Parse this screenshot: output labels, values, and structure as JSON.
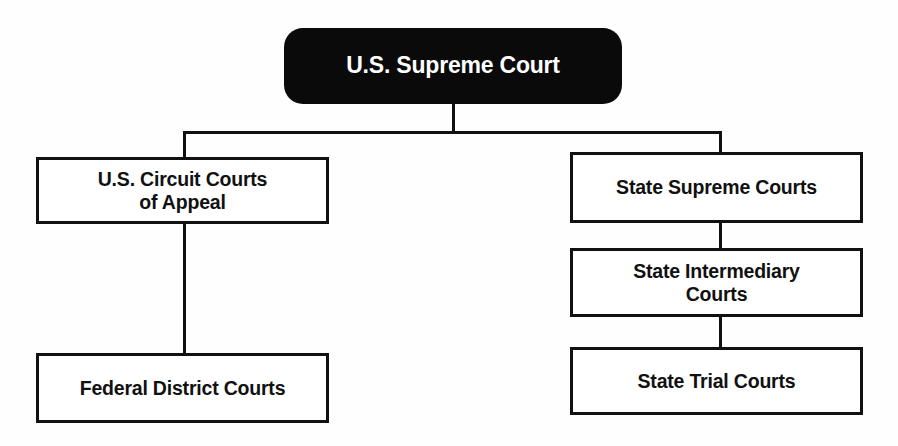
{
  "diagram": {
    "type": "organizational-tree",
    "colors": {
      "root_fill": "#0a0a0a",
      "root_text": "#ffffff",
      "box_fill": "#ffffff",
      "box_stroke": "#111111",
      "box_text": "#111111",
      "background": "#fefefe"
    },
    "nodes": {
      "root": {
        "label": "U.S. Supreme Court"
      },
      "circuit": {
        "label": "U.S. Circuit Courts\nof Appeal"
      },
      "district": {
        "label": "Federal District Courts"
      },
      "state_supreme": {
        "label": "State Supreme Courts"
      },
      "state_intermediary": {
        "label": "State Intermediary\nCourts"
      },
      "state_trial": {
        "label": "State Trial Courts"
      }
    },
    "edges": [
      {
        "from": "root",
        "to": "circuit"
      },
      {
        "from": "root",
        "to": "state_supreme"
      },
      {
        "from": "circuit",
        "to": "district"
      },
      {
        "from": "state_supreme",
        "to": "state_intermediary"
      },
      {
        "from": "state_intermediary",
        "to": "state_trial"
      }
    ]
  }
}
